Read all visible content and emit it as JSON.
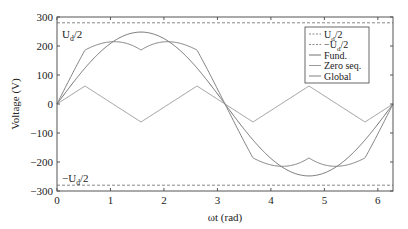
{
  "chart_data": {
    "type": "line",
    "title": "",
    "xlabel": "ωt (rad)",
    "ylabel": "Voltage (V)",
    "xlim": [
      0,
      6.2832
    ],
    "ylim": [
      -300,
      300
    ],
    "xticks": [
      0,
      1,
      2,
      3,
      4,
      5,
      6
    ],
    "yticks": [
      -300,
      -200,
      -100,
      0,
      100,
      200,
      300
    ],
    "grid": false,
    "legend_position": "upper right",
    "annotations": [
      {
        "text": "U_d/2",
        "x": 0.1,
        "y": 250
      },
      {
        "text": "−U_d/2",
        "x": 0.1,
        "y": -255
      }
    ],
    "series": [
      {
        "name": "U_d/2",
        "style": "dashed",
        "color": "#888888",
        "x": [
          0,
          6.2832
        ],
        "y": [
          280,
          280
        ]
      },
      {
        "name": "−U_d/2",
        "style": "dashed",
        "color": "#888888",
        "x": [
          0,
          6.2832
        ],
        "y": [
          -280,
          -280
        ]
      },
      {
        "name": "Fund.",
        "style": "solid",
        "color": "#707070",
        "function": "248*sin(x)",
        "amplitude": 248
      },
      {
        "name": "Zero seq.",
        "style": "solid",
        "color": "#9a9a9a",
        "function": "triangle, 3rd-harmonic",
        "x": [
          0,
          0.5236,
          1.5708,
          2.618,
          3.6652,
          4.7124,
          5.7596,
          6.2832
        ],
        "y": [
          0,
          62,
          -62,
          62,
          -62,
          62,
          -62,
          0
        ]
      },
      {
        "name": "Global",
        "style": "solid",
        "color": "#808080",
        "function": "Fund + Zero seq.",
        "x": [
          0,
          0.5236,
          1.0472,
          1.5708,
          2.0944,
          2.618,
          3.1416,
          3.6652,
          4.1888,
          4.7124,
          5.236,
          5.7596,
          6.2832
        ],
        "y": [
          0,
          186,
          215,
          186,
          215,
          186,
          0,
          -186,
          -215,
          -186,
          -215,
          -186,
          0
        ]
      }
    ]
  },
  "legend": {
    "items": [
      "U_d/2",
      "−U_d/2",
      "Fund.",
      "Zero seq.",
      "Global"
    ]
  }
}
